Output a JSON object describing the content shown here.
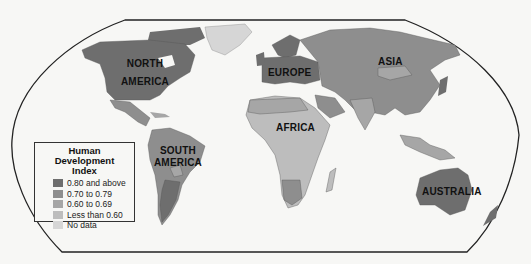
{
  "map": {
    "title": "Human Development Index",
    "labels": {
      "north_america": [
        "NORTH",
        "AMERICA"
      ],
      "south_america": [
        "SOUTH",
        "AMERICA"
      ],
      "europe": "EUROPE",
      "asia": "ASIA",
      "africa": "AFRICA",
      "australia": "AUSTRALIA"
    },
    "legend": {
      "title_line1": "Human Development",
      "title_line2": "Index",
      "items": [
        {
          "label": "0.80 and above",
          "color": "#6e6e6e"
        },
        {
          "label": "0.70 to 0.79",
          "color": "#8e8e8e"
        },
        {
          "label": "0.60 to 0.69",
          "color": "#a6a6a6"
        },
        {
          "label": "Less than 0.60",
          "color": "#bdbdbd"
        },
        {
          "label": "No data",
          "color": "#d6d6d6"
        }
      ]
    },
    "colors": {
      "background": "#f7f7f5",
      "frame": "#222222",
      "border": "#555555"
    }
  }
}
